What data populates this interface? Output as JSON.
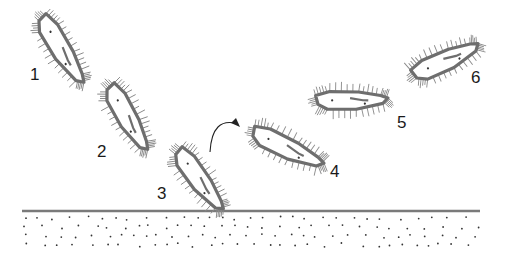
{
  "diagram": {
    "labels": [
      {
        "id": "1",
        "text": "1",
        "x": 30,
        "y": 66
      },
      {
        "id": "2",
        "text": "2",
        "x": 97,
        "y": 143
      },
      {
        "id": "3",
        "text": "3",
        "x": 157,
        "y": 185
      },
      {
        "id": "4",
        "text": "4",
        "x": 330,
        "y": 163
      },
      {
        "id": "5",
        "text": "5",
        "x": 397,
        "y": 114
      },
      {
        "id": "6",
        "text": "6",
        "x": 471,
        "y": 69
      }
    ],
    "cells": [
      {
        "id": "cell-1",
        "cx": 62,
        "cy": 50,
        "length": 78,
        "width": 22,
        "angle": 55
      },
      {
        "id": "cell-2",
        "cx": 128,
        "cy": 118,
        "length": 74,
        "width": 22,
        "angle": 57
      },
      {
        "id": "cell-3",
        "cx": 200,
        "cy": 180,
        "length": 74,
        "width": 22,
        "angle": 50
      },
      {
        "id": "cell-4",
        "cx": 288,
        "cy": 148,
        "length": 78,
        "width": 22,
        "angle": 22
      },
      {
        "id": "cell-5",
        "cx": 352,
        "cy": 100,
        "length": 72,
        "width": 20,
        "angle": -4
      },
      {
        "id": "cell-6",
        "cx": 446,
        "cy": 60,
        "length": 72,
        "width": 22,
        "angle": -28
      }
    ],
    "arrow": {
      "from": [
        210,
        152
      ],
      "control": [
        212,
        116
      ],
      "to": [
        238,
        124
      ],
      "meaning": "rotation"
    },
    "substrate": {
      "line_y": 211,
      "x_start": 22,
      "x_end": 480,
      "line_color": "#7a7a7a",
      "dot_color": "#333333"
    },
    "colors": {
      "outline": "#6e6e6e",
      "cilia": "#8a8a8a",
      "dots": "#333333",
      "text": "#1a1a1a"
    }
  }
}
